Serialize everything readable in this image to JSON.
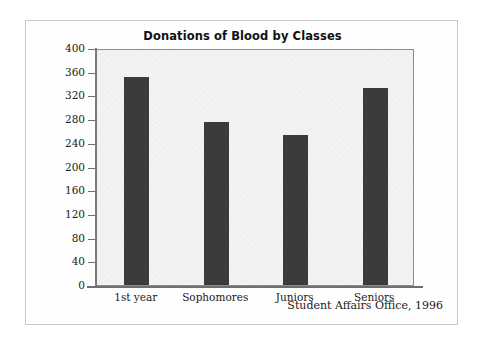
{
  "figure": {
    "source_note": "Student Affairs Office, 1996"
  },
  "chart_data": {
    "type": "bar",
    "title": "Donations of Blood by Classes",
    "xlabel": "",
    "ylabel": "",
    "categories": [
      "1st year",
      "Sophomores",
      "Juniors",
      "Seniors"
    ],
    "values": [
      351,
      275,
      253,
      333
    ],
    "ylim": [
      0,
      400
    ],
    "yticks": [
      0,
      40,
      80,
      120,
      160,
      200,
      240,
      280,
      320,
      360,
      400
    ],
    "ytick_labels": [
      "0",
      "40",
      "80",
      "120",
      "160",
      "200",
      "240",
      "280",
      "320",
      "360",
      "400"
    ],
    "grid": false,
    "legend": null,
    "bar_color": "#3b3b3b",
    "plot_background": "#f3f3f3",
    "axis_color": "#6f6f6f"
  }
}
